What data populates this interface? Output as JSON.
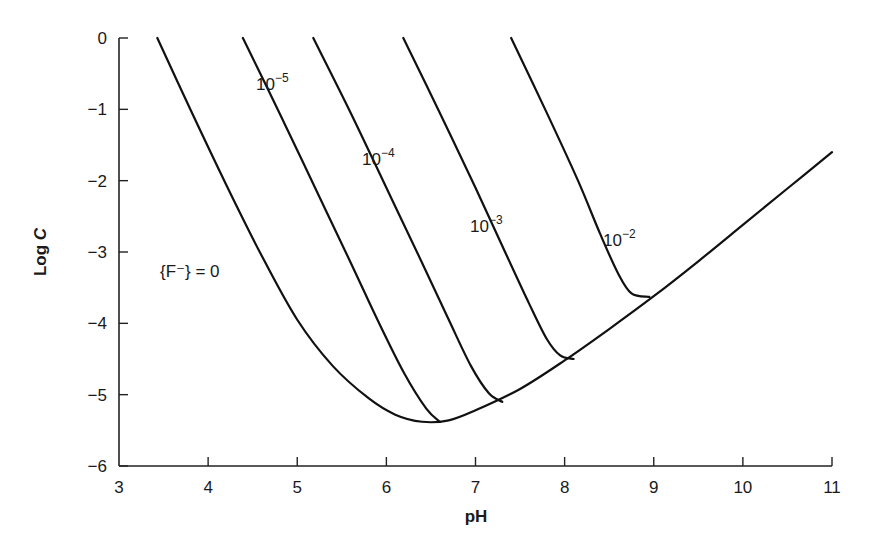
{
  "chart_data": {
    "type": "line",
    "title": "",
    "xlabel": "pH",
    "ylabel": "Log C",
    "xlim": [
      3,
      11
    ],
    "ylim": [
      -6,
      0
    ],
    "xticks": [
      3,
      4,
      5,
      6,
      7,
      8,
      9,
      10,
      11
    ],
    "yticks": [
      0,
      -1,
      -2,
      -3,
      -4,
      -5,
      -6
    ],
    "xtick_labels": [
      "3",
      "4",
      "5",
      "6",
      "7",
      "8",
      "9",
      "10",
      "11"
    ],
    "ytick_labels": [
      "0",
      "−1",
      "−2",
      "−3",
      "−4",
      "−5",
      "−6"
    ],
    "grid": false,
    "legend": "none (curves labeled inline)",
    "series": [
      {
        "name": "{F⁻} = 0",
        "label_text": "{F⁻} = 0",
        "x": [
          3.43,
          3.8,
          4.2,
          4.6,
          5.0,
          5.4,
          5.8,
          6.1,
          6.4,
          6.7,
          7.0,
          7.5,
          8.0,
          8.5,
          9.0,
          9.5,
          10.0,
          10.5,
          11.0
        ],
        "y": [
          0,
          -1.0,
          -2.05,
          -3.05,
          -3.95,
          -4.6,
          -5.05,
          -5.28,
          -5.38,
          -5.36,
          -5.22,
          -4.92,
          -4.52,
          -4.08,
          -3.62,
          -3.13,
          -2.62,
          -2.11,
          -1.6
        ]
      },
      {
        "name": "10⁻⁵",
        "label_text": "10",
        "label_exp": "−5",
        "x": [
          4.39,
          4.8,
          5.2,
          5.6,
          5.9,
          6.2,
          6.45,
          6.6
        ],
        "y": [
          0,
          -1.05,
          -2.1,
          -3.15,
          -3.95,
          -4.7,
          -5.2,
          -5.38
        ]
      },
      {
        "name": "10⁻⁴",
        "label_text": "10",
        "label_exp": "−4",
        "x": [
          5.18,
          5.6,
          6.0,
          6.4,
          6.7,
          6.95,
          7.15,
          7.3
        ],
        "y": [
          0,
          -1.05,
          -2.1,
          -3.15,
          -3.95,
          -4.6,
          -4.98,
          -5.1
        ]
      },
      {
        "name": "10⁻³",
        "label_text": "10",
        "label_exp": "−3",
        "x": [
          6.19,
          6.6,
          7.0,
          7.35,
          7.6,
          7.8,
          7.95,
          8.1
        ],
        "y": [
          0,
          -1.05,
          -2.1,
          -3.05,
          -3.72,
          -4.22,
          -4.45,
          -4.5
        ]
      },
      {
        "name": "10⁻²",
        "label_text": "10",
        "label_exp": "−2",
        "x": [
          7.4,
          7.8,
          8.15,
          8.4,
          8.6,
          8.75,
          8.95
        ],
        "y": [
          0,
          -1.05,
          -2.0,
          -2.75,
          -3.3,
          -3.58,
          -3.63
        ]
      }
    ]
  },
  "labels": {
    "x_axis_title": "pH",
    "y_axis_title_log": "Log ",
    "y_axis_title_var": "C",
    "f_zero_label": "{F⁻} = 0"
  }
}
